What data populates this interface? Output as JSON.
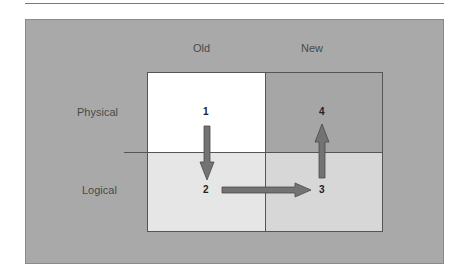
{
  "diagram": {
    "columns": [
      "Old",
      "New"
    ],
    "rows": [
      "Physical",
      "Logical"
    ],
    "steps": [
      {
        "id": "1",
        "quadrant": "old-physical"
      },
      {
        "id": "2",
        "quadrant": "old-logical"
      },
      {
        "id": "3",
        "quadrant": "new-logical"
      },
      {
        "id": "4",
        "quadrant": "new-physical"
      }
    ],
    "arrows": [
      {
        "from": "1",
        "to": "2",
        "direction": "down"
      },
      {
        "from": "2",
        "to": "3",
        "direction": "right"
      },
      {
        "from": "3",
        "to": "4",
        "direction": "up"
      }
    ],
    "colors": {
      "panel": "#a9a9a9",
      "old_physical": "#ffffff",
      "new_physical": "#a6a6a6",
      "old_logical": "#e6e6e6",
      "new_logical": "#d7d7d7",
      "arrow": "#737373"
    }
  }
}
